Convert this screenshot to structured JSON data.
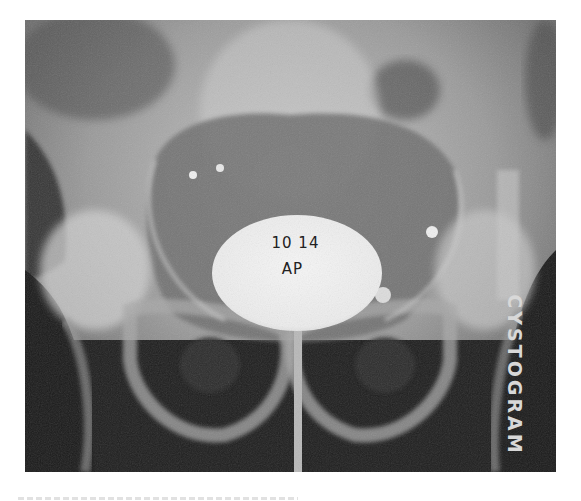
{
  "image": {
    "type": "radiograph",
    "view_annotation": {
      "line1": "10 14",
      "line2": "AP"
    },
    "side_label": "CYSTOGRAM"
  },
  "colors": {
    "background": "#ffffff",
    "film_dark": "#1c1c1c",
    "film_mid": "#8a8a8a",
    "contrast_bright": "#f2f2f2"
  }
}
